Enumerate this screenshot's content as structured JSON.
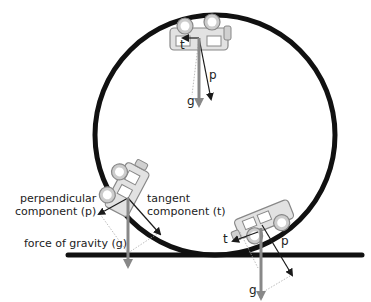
{
  "diagram": {
    "colors": {
      "track": "#111111",
      "gravity_arrow": "#888888",
      "component_arrow": "#1a1a1a",
      "dotted_guide": "#999999",
      "car_fill": "#e2e2e2",
      "car_stroke": "#888888"
    },
    "labels": {
      "top_car": {
        "t": "t",
        "p": "p",
        "g": "g"
      },
      "left_car": {
        "perpendicular": "perpendicular\ncomponent (p)",
        "tangent": "tangent\ncomponent (t)",
        "gravity": "force of gravity (g)"
      },
      "right_car": {
        "t": "t",
        "p": "p",
        "g": "g"
      }
    },
    "elements": [
      "loop-track",
      "ground-line",
      "car-top",
      "car-left",
      "car-right",
      "gravity-vectors",
      "tangent-vectors",
      "perpendicular-vectors"
    ]
  }
}
